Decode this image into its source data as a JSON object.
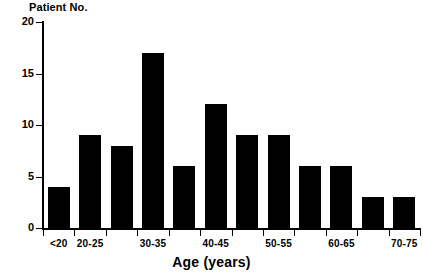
{
  "chart_data": {
    "type": "bar",
    "title": "",
    "xlabel": "Age (years)",
    "ylabel": "Patient No.",
    "grid": false,
    "legend": null,
    "ylim": [
      0,
      20
    ],
    "yticks": [
      0,
      5,
      10,
      15,
      20
    ],
    "ytick_labels": [
      "0",
      "5",
      "10",
      "15",
      "20"
    ],
    "categories": [
      "<20",
      "20-25",
      "25-30",
      "30-35",
      "35-40",
      "40-45",
      "45-50",
      "50-55",
      "55-60",
      "60-65",
      "65-70",
      "70-75"
    ],
    "visible_tick_labels": [
      "<20",
      "20-25",
      "30-35",
      "40-45",
      "50-55",
      "60-65",
      "70-75"
    ],
    "values": [
      4,
      9,
      8,
      17,
      6,
      12,
      9,
      9,
      6,
      6,
      3,
      3
    ],
    "bar_color": "#000000",
    "axis_color": "#000000",
    "background": "#ffffff"
  }
}
